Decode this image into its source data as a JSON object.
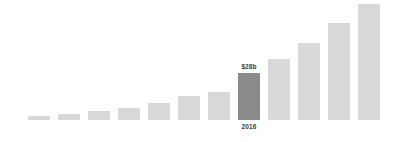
{
  "chart_data": {
    "type": "bar",
    "title": "",
    "subtitle": "",
    "xlabel": "",
    "ylabel": "",
    "grid": false,
    "legend": null,
    "axis_visible": false,
    "ylim": [
      0,
      120
    ],
    "categories": [
      "",
      "",
      "",
      "",
      "",
      "",
      "",
      "2016",
      "",
      "",
      "",
      ""
    ],
    "values": [
      4,
      6,
      9,
      12,
      17,
      24,
      28,
      48,
      62,
      78,
      99,
      118
    ],
    "series": [
      {
        "name": "value",
        "values": [
          4,
          6,
          9,
          12,
          17,
          24,
          28,
          48,
          62,
          78,
          99,
          118
        ]
      }
    ],
    "annotations": [
      {
        "index": 7,
        "value_label": "$28b",
        "category_label": "2016"
      }
    ],
    "highlight_index": 7,
    "colors": {
      "bar": "#d9d9d9",
      "bar_highlight": "#8a8a8a",
      "label_text": "#3c3c3c",
      "background": "#ffffff"
    },
    "layout": {
      "bar_width": 22,
      "bar_gap": 8,
      "first_bar_x": 28,
      "baseline_y": 120
    }
  }
}
